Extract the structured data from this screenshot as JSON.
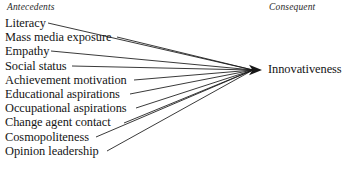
{
  "figure": {
    "background_color": "#ffffff",
    "line_color": "#171717",
    "text_color": "#151515"
  },
  "headers": {
    "left": "Antecedents",
    "right": "Consequent"
  },
  "antecedents": [
    {
      "label": "Literacy",
      "line_start_x": 48,
      "y": 23
    },
    {
      "label": "Mass media exposure",
      "line_start_x": 117,
      "y": 37
    },
    {
      "label": "Empathy",
      "line_start_x": 51,
      "y": 51
    },
    {
      "label": "Social status",
      "line_start_x": 72,
      "y": 66
    },
    {
      "label": "Achievement motivation",
      "line_start_x": 134,
      "y": 80
    },
    {
      "label": "Educational aspirations",
      "line_start_x": 130,
      "y": 94
    },
    {
      "label": "Occupational aspirations",
      "line_start_x": 136,
      "y": 108
    },
    {
      "label": "Change agent contact",
      "line_start_x": 124,
      "y": 123
    },
    {
      "label": "Cosmopoliteness",
      "line_start_x": 96,
      "y": 137
    },
    {
      "label": "Opinion leadership",
      "line_start_x": 107,
      "y": 151
    }
  ],
  "consequent": {
    "label": "Innovativeness",
    "arrow_tip_x": 262,
    "arrow_tip_y": 70
  },
  "chart_data": {
    "type": "diagram",
    "diagram_kind": "converging-arrow-model",
    "nodes_left": [
      "Literacy",
      "Mass media exposure",
      "Empathy",
      "Social status",
      "Achievement motivation",
      "Educational aspirations",
      "Occupational aspirations",
      "Change agent contact",
      "Cosmopoliteness",
      "Opinion leadership"
    ],
    "nodes_right": [
      "Innovativeness"
    ],
    "edges": [
      {
        "from": "Literacy",
        "to": "Innovativeness"
      },
      {
        "from": "Mass media exposure",
        "to": "Innovativeness"
      },
      {
        "from": "Empathy",
        "to": "Innovativeness"
      },
      {
        "from": "Social status",
        "to": "Innovativeness"
      },
      {
        "from": "Achievement motivation",
        "to": "Innovativeness"
      },
      {
        "from": "Educational aspirations",
        "to": "Innovativeness"
      },
      {
        "from": "Occupational aspirations",
        "to": "Innovativeness"
      },
      {
        "from": "Change agent contact",
        "to": "Innovativeness"
      },
      {
        "from": "Cosmopoliteness",
        "to": "Innovativeness"
      },
      {
        "from": "Opinion leadership",
        "to": "Innovativeness"
      }
    ],
    "column_headers": [
      "Antecedents",
      "Consequent"
    ],
    "edge_count": 10,
    "legend": null,
    "grid": false
  }
}
